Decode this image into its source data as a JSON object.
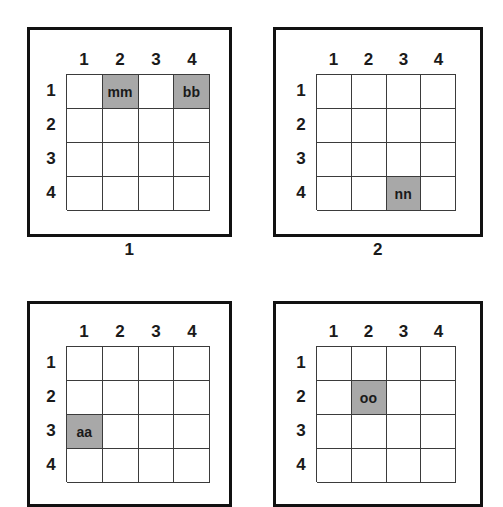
{
  "figure": {
    "background_color": "#ffffff",
    "shaded_cell_color": "#a8a8a8",
    "grid_line_color": "#3b3b3b",
    "frame_color": "#111111"
  },
  "panels": [
    {
      "caption": "1",
      "caption_visible": true,
      "column_headers": [
        "1",
        "2",
        "3",
        "4"
      ],
      "row_headers": [
        "1",
        "2",
        "3",
        "4"
      ],
      "cells": [
        [
          "",
          "mm",
          "",
          "bb"
        ],
        [
          "",
          "",
          "",
          ""
        ],
        [
          "",
          "",
          "",
          ""
        ],
        [
          "",
          "",
          "",
          ""
        ]
      ],
      "shaded": [
        [
          false,
          true,
          false,
          true
        ],
        [
          false,
          false,
          false,
          false
        ],
        [
          false,
          false,
          false,
          false
        ],
        [
          false,
          false,
          false,
          false
        ]
      ]
    },
    {
      "caption": "2",
      "caption_visible": true,
      "column_headers": [
        "1",
        "2",
        "3",
        "4"
      ],
      "row_headers": [
        "1",
        "2",
        "3",
        "4"
      ],
      "cells": [
        [
          "",
          "",
          "",
          ""
        ],
        [
          "",
          "",
          "",
          ""
        ],
        [
          "",
          "",
          "",
          ""
        ],
        [
          "",
          "",
          "nn",
          ""
        ]
      ],
      "shaded": [
        [
          false,
          false,
          false,
          false
        ],
        [
          false,
          false,
          false,
          false
        ],
        [
          false,
          false,
          false,
          false
        ],
        [
          false,
          false,
          true,
          false
        ]
      ]
    },
    {
      "caption": "",
      "caption_visible": false,
      "column_headers": [
        "1",
        "2",
        "3",
        "4"
      ],
      "row_headers": [
        "1",
        "2",
        "3",
        "4"
      ],
      "cells": [
        [
          "",
          "",
          "",
          ""
        ],
        [
          "",
          "",
          "",
          ""
        ],
        [
          "aa",
          "",
          "",
          ""
        ],
        [
          "",
          "",
          "",
          ""
        ]
      ],
      "shaded": [
        [
          false,
          false,
          false,
          false
        ],
        [
          false,
          false,
          false,
          false
        ],
        [
          true,
          false,
          false,
          false
        ],
        [
          false,
          false,
          false,
          false
        ]
      ]
    },
    {
      "caption": "",
      "caption_visible": false,
      "column_headers": [
        "1",
        "2",
        "3",
        "4"
      ],
      "row_headers": [
        "1",
        "2",
        "3",
        "4"
      ],
      "cells": [
        [
          "",
          "",
          "",
          ""
        ],
        [
          "",
          "oo",
          "",
          ""
        ],
        [
          "",
          "",
          "",
          ""
        ],
        [
          "",
          "",
          "",
          ""
        ]
      ],
      "shaded": [
        [
          false,
          false,
          false,
          false
        ],
        [
          false,
          true,
          false,
          false
        ],
        [
          false,
          false,
          false,
          false
        ],
        [
          false,
          false,
          false,
          false
        ]
      ]
    }
  ]
}
